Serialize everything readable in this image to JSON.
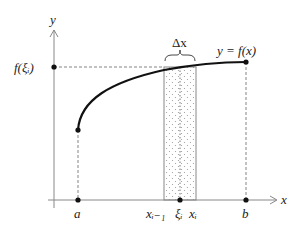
{
  "figure": {
    "type": "riemann-sum-rectangle",
    "axes": {
      "x_label": "x",
      "y_label": "y"
    },
    "curve_label": "y = f(x)",
    "height_label": "f(ξᵢ)",
    "width_label": "Δx",
    "x_ticks": [
      {
        "name": "a",
        "label": "a"
      },
      {
        "name": "x-i-minus-1",
        "label": "xᵢ₋₁"
      },
      {
        "name": "xi-i",
        "label": "ξᵢ"
      },
      {
        "name": "x-i",
        "label": "xᵢ"
      },
      {
        "name": "b",
        "label": "b"
      }
    ],
    "colors": {
      "curve": "#111111",
      "axis": "#888888",
      "dashed": "#666666",
      "rect_border": "#888888",
      "dots": "#999999"
    }
  }
}
